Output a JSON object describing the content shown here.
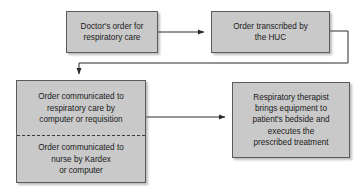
{
  "diagram": {
    "colors": {
      "node_fill": "#c9c9c9",
      "node_border": "#5a5a5a",
      "connector": "#2b2b2b",
      "background": "#ffffff",
      "divider": "#3a3a3a"
    },
    "nodes": {
      "doctor_order": {
        "lines": [
          "Doctor's order for",
          "respiratory care"
        ]
      },
      "order_transcribed": {
        "lines": [
          "Order transcribed by",
          "the HUC"
        ]
      },
      "order_communicated_respiratory": {
        "lines": [
          "Order communicated to",
          "respiratory care by",
          "computer or requisition"
        ]
      },
      "order_communicated_nurse": {
        "lines": [
          "Order communicated to",
          "nurse by Kardex",
          "or computer"
        ]
      },
      "therapist_executes": {
        "lines": [
          "Respiratory therapist",
          "brings equipment to",
          "patient's bedside and",
          "executes the",
          "prescribed treatment"
        ]
      }
    },
    "connectors": [
      {
        "name": "doctor-order-to-transcribed",
        "from": "doctor_order",
        "to": "order_transcribed"
      },
      {
        "name": "transcribed-to-communicated",
        "from": "order_transcribed",
        "to": "order_communicated_respiratory"
      },
      {
        "name": "communicated-to-therapist",
        "from": "order_communicated_respiratory",
        "to": "therapist_executes"
      }
    ]
  }
}
